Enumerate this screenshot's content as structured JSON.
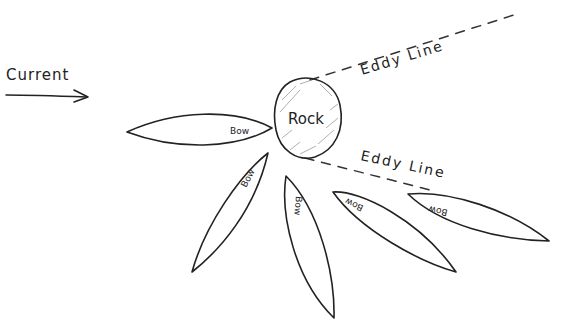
{
  "diagram": {
    "current": {
      "label": "Current",
      "direction": "right"
    },
    "rock": {
      "label": "Rock"
    },
    "eddy_lines": [
      {
        "label": "Eddy Line",
        "position": "upper"
      },
      {
        "label": "Eddy Line",
        "position": "lower"
      }
    ],
    "boats": [
      {
        "label": "Bow",
        "position": "left, pointing at rock"
      },
      {
        "label": "Bow",
        "position": "lower-left"
      },
      {
        "label": "Bow",
        "position": "below rock"
      },
      {
        "label": "Bow",
        "position": "lower-right"
      },
      {
        "label": "Bow",
        "position": "right, in eddy"
      }
    ],
    "colors": {
      "ink": "#222222",
      "background": "#ffffff"
    }
  }
}
